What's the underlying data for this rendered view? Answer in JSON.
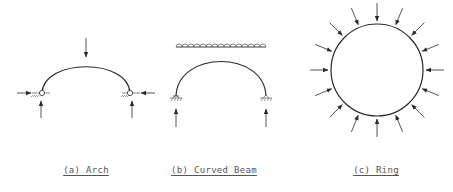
{
  "figure": {
    "panels": [
      {
        "id": "a",
        "label": "(a) Arch",
        "label_x": 86,
        "label_y": 165
      },
      {
        "id": "b",
        "label": "(b) Curved Beam",
        "label_x": 214,
        "label_y": 165
      },
      {
        "id": "c",
        "label": "(c) Ring",
        "label_x": 376,
        "label_y": 165
      }
    ],
    "colors": {
      "stroke": "#2a2a2a",
      "label": "#555555"
    }
  }
}
